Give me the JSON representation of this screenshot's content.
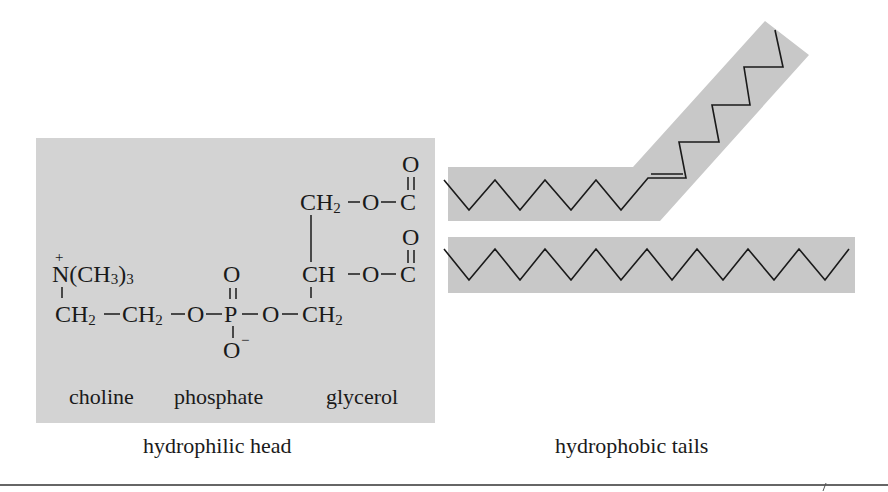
{
  "figure": {
    "colors": {
      "panel_fill": "#d3d3d3",
      "ink": "#1a1a1a",
      "background": "#ffffff"
    },
    "head": {
      "formula": {
        "ammonium": "N(CH3)3",
        "ammonium_charge": "+",
        "row_main": [
          "CH2",
          "CH2",
          "O",
          "P",
          "O",
          "CH2"
        ],
        "phosphate_double_O": "O",
        "phosphate_single_O": "O",
        "phosphate_charge": "−",
        "glycerol_top": [
          "CH2",
          "O",
          "C"
        ],
        "glycerol_middle": [
          "CH",
          "O",
          "C"
        ],
        "carbonyl_O_top": "O",
        "carbonyl_O_middle": "O"
      },
      "group_labels": {
        "choline": "choline",
        "phosphate": "phosphate",
        "glycerol": "glycerol"
      },
      "caption": "hydrophilic head"
    },
    "tails": {
      "caption": "hydrophobic tails",
      "items": [
        {
          "name": "unsaturated-tail",
          "kinked": true,
          "has_double_bond": true
        },
        {
          "name": "saturated-tail",
          "kinked": false,
          "has_double_bond": false
        }
      ]
    }
  }
}
